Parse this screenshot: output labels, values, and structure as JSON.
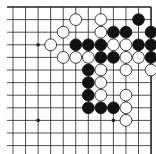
{
  "board": {
    "region": "top-right corner",
    "cols": 12,
    "rows": 12,
    "origin_x": 13,
    "origin_y": 7,
    "spacing_x": 12.55,
    "spacing_y": 12.6,
    "edges": {
      "top": true,
      "right": true,
      "left": false,
      "bottom": false
    },
    "line_color": "#222222",
    "background": "#ffffff",
    "star_points": [
      {
        "col": 2,
        "row": 3
      },
      {
        "col": 2,
        "row": 9
      },
      {
        "col": 8,
        "row": 9
      }
    ],
    "stones": [
      {
        "color": "white",
        "col": 5,
        "row": 1
      },
      {
        "color": "white",
        "col": 7,
        "row": 1
      },
      {
        "color": "black",
        "col": 10,
        "row": 1
      },
      {
        "color": "white",
        "col": 4,
        "row": 2
      },
      {
        "color": "white",
        "col": 7,
        "row": 2
      },
      {
        "color": "black",
        "col": 8,
        "row": 2
      },
      {
        "color": "black",
        "col": 9,
        "row": 2
      },
      {
        "color": "black",
        "col": 11,
        "row": 2
      },
      {
        "color": "white",
        "col": 3,
        "row": 3
      },
      {
        "color": "black",
        "col": 5,
        "row": 3
      },
      {
        "color": "black",
        "col": 6,
        "row": 3
      },
      {
        "color": "black",
        "col": 7,
        "row": 3
      },
      {
        "color": "white",
        "col": 8,
        "row": 3
      },
      {
        "color": "white",
        "col": 9,
        "row": 3
      },
      {
        "color": "black",
        "col": 10,
        "row": 3
      },
      {
        "color": "black",
        "col": 11,
        "row": 3
      },
      {
        "color": "white",
        "col": 4,
        "row": 4
      },
      {
        "color": "white",
        "col": 5,
        "row": 4
      },
      {
        "color": "white",
        "col": 6,
        "row": 4
      },
      {
        "color": "black",
        "col": 7,
        "row": 4
      },
      {
        "color": "black",
        "col": 8,
        "row": 4
      },
      {
        "color": "white",
        "col": 9,
        "row": 4
      },
      {
        "color": "white",
        "col": 10,
        "row": 4
      },
      {
        "color": "black",
        "col": 11,
        "row": 4
      },
      {
        "color": "black",
        "col": 6,
        "row": 5
      },
      {
        "color": "white",
        "col": 7,
        "row": 5
      },
      {
        "color": "white",
        "col": 9,
        "row": 5
      },
      {
        "color": "white",
        "col": 11,
        "row": 5
      },
      {
        "color": "black",
        "col": 6,
        "row": 6
      },
      {
        "color": "white",
        "col": 7,
        "row": 6
      },
      {
        "color": "black",
        "col": 6,
        "row": 7
      },
      {
        "color": "white",
        "col": 7,
        "row": 7
      },
      {
        "color": "white",
        "col": 9,
        "row": 7
      },
      {
        "color": "black",
        "col": 6,
        "row": 8
      },
      {
        "color": "black",
        "col": 7,
        "row": 8
      },
      {
        "color": "black",
        "col": 8,
        "row": 8
      },
      {
        "color": "white",
        "col": 9,
        "row": 8
      },
      {
        "color": "white",
        "col": 9,
        "row": 9
      }
    ]
  }
}
